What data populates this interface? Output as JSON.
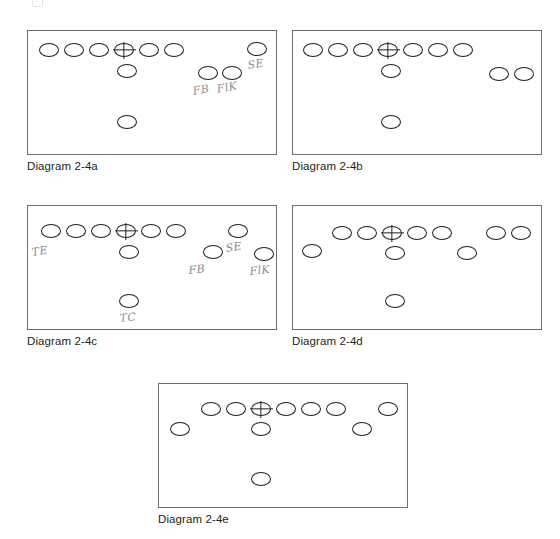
{
  "page": {
    "width": 560,
    "height": 539,
    "background": "#ffffff",
    "ink_color": "#231f20",
    "box_border_color": "#6d6e71",
    "pencil_color": "#8d8d8d",
    "top_artifact_name": "cut-off-glyph"
  },
  "diagrams": [
    {
      "id": "2-4a",
      "caption": "Diagram 2-4a",
      "box": {
        "x": 27,
        "y": 30,
        "w": 250,
        "h": 125
      },
      "caption_pos": {
        "x": 27,
        "y": 159
      },
      "players": [
        {
          "name": "lineman-1",
          "x": 39,
          "y": 43,
          "w": 20,
          "h": 14,
          "center": false
        },
        {
          "name": "lineman-2",
          "x": 64,
          "y": 43,
          "w": 20,
          "h": 14,
          "center": false
        },
        {
          "name": "lineman-3",
          "x": 89,
          "y": 43,
          "w": 20,
          "h": 14,
          "center": false
        },
        {
          "name": "center",
          "x": 114,
          "y": 43,
          "w": 20,
          "h": 14,
          "center": true
        },
        {
          "name": "lineman-5",
          "x": 139,
          "y": 43,
          "w": 20,
          "h": 14,
          "center": false
        },
        {
          "name": "lineman-6",
          "x": 164,
          "y": 43,
          "w": 20,
          "h": 14,
          "center": false
        },
        {
          "name": "split-end",
          "x": 247,
          "y": 42,
          "w": 20,
          "h": 14,
          "center": false
        },
        {
          "name": "quarterback",
          "x": 117,
          "y": 64,
          "w": 20,
          "h": 14,
          "center": false
        },
        {
          "name": "fullback",
          "x": 198,
          "y": 66,
          "w": 20,
          "h": 14,
          "center": false
        },
        {
          "name": "flanker",
          "x": 222,
          "y": 66,
          "w": 20,
          "h": 14,
          "center": false
        },
        {
          "name": "tailback",
          "x": 117,
          "y": 115,
          "w": 20,
          "h": 14,
          "center": false
        }
      ],
      "annotations": [
        {
          "name": "label-se",
          "text": "SE",
          "x": 247,
          "y": 60,
          "rotate": -8,
          "size": 11
        },
        {
          "name": "label-fb",
          "text": "FB",
          "x": 192,
          "y": 86,
          "rotate": -10,
          "size": 11
        },
        {
          "name": "label-flk",
          "text": "FlK",
          "x": 216,
          "y": 84,
          "rotate": -10,
          "size": 11
        }
      ]
    },
    {
      "id": "2-4b",
      "caption": "Diagram 2-4b",
      "box": {
        "x": 292,
        "y": 30,
        "w": 250,
        "h": 125
      },
      "caption_pos": {
        "x": 292,
        "y": 159
      },
      "players": [
        {
          "name": "lineman-1",
          "x": 303,
          "y": 43,
          "w": 20,
          "h": 14,
          "center": false
        },
        {
          "name": "lineman-2",
          "x": 328,
          "y": 43,
          "w": 20,
          "h": 14,
          "center": false
        },
        {
          "name": "lineman-3",
          "x": 353,
          "y": 43,
          "w": 20,
          "h": 14,
          "center": false
        },
        {
          "name": "center",
          "x": 378,
          "y": 43,
          "w": 20,
          "h": 14,
          "center": true
        },
        {
          "name": "lineman-5",
          "x": 403,
          "y": 43,
          "w": 20,
          "h": 14,
          "center": false
        },
        {
          "name": "lineman-6",
          "x": 428,
          "y": 43,
          "w": 20,
          "h": 14,
          "center": false
        },
        {
          "name": "tight-end",
          "x": 453,
          "y": 43,
          "w": 20,
          "h": 14,
          "center": false
        },
        {
          "name": "quarterback",
          "x": 381,
          "y": 64,
          "w": 20,
          "h": 14,
          "center": false
        },
        {
          "name": "flanker",
          "x": 489,
          "y": 67,
          "w": 20,
          "h": 14,
          "center": false
        },
        {
          "name": "split-end",
          "x": 514,
          "y": 67,
          "w": 20,
          "h": 14,
          "center": false
        },
        {
          "name": "tailback",
          "x": 381,
          "y": 115,
          "w": 20,
          "h": 14,
          "center": false
        }
      ],
      "annotations": []
    },
    {
      "id": "2-4c",
      "caption": "Diagram 2-4c",
      "box": {
        "x": 27,
        "y": 205,
        "w": 250,
        "h": 125
      },
      "caption_pos": {
        "x": 27,
        "y": 334
      },
      "players": [
        {
          "name": "lineman-1",
          "x": 41,
          "y": 224,
          "w": 20,
          "h": 14,
          "center": false
        },
        {
          "name": "lineman-2",
          "x": 66,
          "y": 224,
          "w": 20,
          "h": 14,
          "center": false
        },
        {
          "name": "lineman-3",
          "x": 91,
          "y": 224,
          "w": 20,
          "h": 14,
          "center": false
        },
        {
          "name": "center",
          "x": 116,
          "y": 224,
          "w": 20,
          "h": 14,
          "center": true
        },
        {
          "name": "lineman-5",
          "x": 141,
          "y": 224,
          "w": 20,
          "h": 14,
          "center": false
        },
        {
          "name": "lineman-6",
          "x": 166,
          "y": 224,
          "w": 20,
          "h": 14,
          "center": false
        },
        {
          "name": "split-end",
          "x": 228,
          "y": 224,
          "w": 20,
          "h": 14,
          "center": false
        },
        {
          "name": "quarterback",
          "x": 119,
          "y": 245,
          "w": 20,
          "h": 14,
          "center": false
        },
        {
          "name": "fullback",
          "x": 203,
          "y": 245,
          "w": 20,
          "h": 14,
          "center": false
        },
        {
          "name": "flanker",
          "x": 254,
          "y": 247,
          "w": 20,
          "h": 14,
          "center": false
        },
        {
          "name": "tailback",
          "x": 119,
          "y": 294,
          "w": 20,
          "h": 14,
          "center": false
        }
      ],
      "annotations": [
        {
          "name": "label-te",
          "text": "TE",
          "x": 31,
          "y": 247,
          "rotate": -8,
          "size": 11
        },
        {
          "name": "label-se",
          "text": "SE",
          "x": 225,
          "y": 243,
          "rotate": -8,
          "size": 11
        },
        {
          "name": "label-fb",
          "text": "FB",
          "x": 188,
          "y": 265,
          "rotate": -6,
          "size": 11
        },
        {
          "name": "label-flk",
          "text": "FlK",
          "x": 249,
          "y": 266,
          "rotate": -6,
          "size": 11
        },
        {
          "name": "label-tc",
          "text": "TC",
          "x": 119,
          "y": 313,
          "rotate": -6,
          "size": 11
        }
      ]
    },
    {
      "id": "2-4d",
      "caption": "Diagram 2-4d",
      "box": {
        "x": 292,
        "y": 205,
        "w": 250,
        "h": 125
      },
      "caption_pos": {
        "x": 292,
        "y": 334
      },
      "players": [
        {
          "name": "split-end-left",
          "x": 302,
          "y": 244,
          "w": 20,
          "h": 14,
          "center": false
        },
        {
          "name": "lineman-1",
          "x": 332,
          "y": 226,
          "w": 20,
          "h": 14,
          "center": false
        },
        {
          "name": "lineman-2",
          "x": 357,
          "y": 226,
          "w": 20,
          "h": 14,
          "center": false
        },
        {
          "name": "center",
          "x": 382,
          "y": 226,
          "w": 20,
          "h": 14,
          "center": true
        },
        {
          "name": "lineman-4",
          "x": 407,
          "y": 226,
          "w": 20,
          "h": 14,
          "center": false
        },
        {
          "name": "lineman-5",
          "x": 432,
          "y": 226,
          "w": 20,
          "h": 14,
          "center": false
        },
        {
          "name": "flanker",
          "x": 486,
          "y": 226,
          "w": 20,
          "h": 14,
          "center": false
        },
        {
          "name": "tight-end",
          "x": 511,
          "y": 226,
          "w": 20,
          "h": 14,
          "center": false
        },
        {
          "name": "quarterback",
          "x": 385,
          "y": 246,
          "w": 20,
          "h": 14,
          "center": false
        },
        {
          "name": "slot-back",
          "x": 457,
          "y": 246,
          "w": 20,
          "h": 14,
          "center": false
        },
        {
          "name": "tailback",
          "x": 385,
          "y": 294,
          "w": 20,
          "h": 14,
          "center": false
        }
      ],
      "annotations": []
    },
    {
      "id": "2-4e",
      "caption": "Diagram 2-4e",
      "box": {
        "x": 158,
        "y": 383,
        "w": 250,
        "h": 125
      },
      "caption_pos": {
        "x": 158,
        "y": 512
      },
      "players": [
        {
          "name": "split-end-left",
          "x": 170,
          "y": 422,
          "w": 20,
          "h": 14,
          "center": false
        },
        {
          "name": "lineman-1",
          "x": 201,
          "y": 402,
          "w": 20,
          "h": 14,
          "center": false
        },
        {
          "name": "lineman-2",
          "x": 226,
          "y": 402,
          "w": 20,
          "h": 14,
          "center": false
        },
        {
          "name": "center",
          "x": 251,
          "y": 402,
          "w": 20,
          "h": 14,
          "center": true
        },
        {
          "name": "lineman-4",
          "x": 276,
          "y": 402,
          "w": 20,
          "h": 14,
          "center": false
        },
        {
          "name": "lineman-5",
          "x": 301,
          "y": 402,
          "w": 20,
          "h": 14,
          "center": false
        },
        {
          "name": "lineman-6",
          "x": 326,
          "y": 402,
          "w": 20,
          "h": 14,
          "center": false
        },
        {
          "name": "tight-end",
          "x": 378,
          "y": 402,
          "w": 20,
          "h": 14,
          "center": false
        },
        {
          "name": "quarterback",
          "x": 251,
          "y": 422,
          "w": 20,
          "h": 14,
          "center": false
        },
        {
          "name": "slot-back",
          "x": 352,
          "y": 422,
          "w": 20,
          "h": 14,
          "center": false
        },
        {
          "name": "tailback",
          "x": 251,
          "y": 472,
          "w": 20,
          "h": 14,
          "center": false
        }
      ],
      "annotations": []
    }
  ]
}
